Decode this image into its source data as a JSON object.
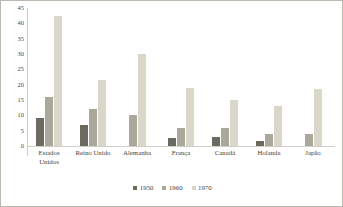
{
  "chart_data": {
    "type": "bar",
    "title": "",
    "subtitle": "",
    "xlabel": "",
    "ylabel": "",
    "ylim": [
      0,
      45
    ],
    "yticks": [
      0,
      5,
      10,
      15,
      20,
      25,
      30,
      35,
      40,
      45
    ],
    "grid": false,
    "legend_position": "bottom",
    "categories": [
      "Estados Unidos",
      "Reino Unido",
      "Alemanha",
      "França",
      "Canadá",
      "Holanda",
      "Japão"
    ],
    "series": [
      {
        "name": "1950",
        "color": "#6a6a61",
        "values": [
          9,
          7,
          0,
          2.5,
          3,
          1.5,
          0
        ]
      },
      {
        "name": "1960",
        "color": "#a9a89a",
        "values": [
          16,
          12,
          10,
          6,
          6,
          4,
          4
        ]
      },
      {
        "name": "1970",
        "color": "#d9d7c9",
        "values": [
          42.5,
          21.5,
          30,
          19,
          15,
          13,
          18.5
        ]
      }
    ]
  },
  "legend": {
    "items": [
      {
        "label": "1950",
        "color": "#6a6a61"
      },
      {
        "label": "1960",
        "color": "#a9a89a"
      },
      {
        "label": "1970",
        "color": "#d9d7c9"
      }
    ]
  },
  "style": {
    "border_color": "#b9b9b0",
    "axis_color": "#cfcfc6",
    "text_color": "#3f3f3b",
    "background": "#ffffff"
  }
}
